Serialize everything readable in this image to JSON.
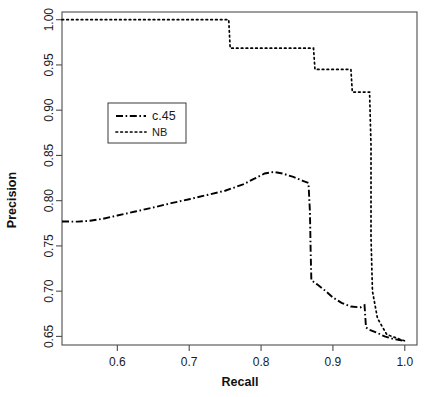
{
  "chart_data": {
    "type": "line",
    "title": "",
    "xlabel": "Recall",
    "ylabel": "Precision",
    "xlim": [
      0.523,
      1.017
    ],
    "ylim": [
      0.6405,
      1.0085
    ],
    "xticks": [
      0.6,
      0.7,
      0.8,
      0.9,
      1.0
    ],
    "xtick_labels": [
      "0.6",
      "0.7",
      "0.8",
      "0.9",
      "1.0"
    ],
    "yticks": [
      0.65,
      0.7,
      0.75,
      0.8,
      0.85,
      0.9,
      0.95,
      1.0
    ],
    "ytick_labels": [
      "0.65",
      "0.70",
      "0.75",
      "0.80",
      "0.85",
      "0.90",
      "0.95",
      "1.00"
    ],
    "grid": false,
    "legend_position": "upper-left-center",
    "series": [
      {
        "name": "c.45",
        "linestyle": "dashdot",
        "color": "#000000",
        "points": [
          [
            0.523,
            0.777
          ],
          [
            0.545,
            0.7768
          ],
          [
            0.562,
            0.7778
          ],
          [
            0.58,
            0.78
          ],
          [
            0.6,
            0.7836
          ],
          [
            0.625,
            0.788
          ],
          [
            0.65,
            0.7925
          ],
          [
            0.675,
            0.7972
          ],
          [
            0.7,
            0.8016
          ],
          [
            0.725,
            0.8063
          ],
          [
            0.75,
            0.811
          ],
          [
            0.775,
            0.818
          ],
          [
            0.79,
            0.824
          ],
          [
            0.805,
            0.83
          ],
          [
            0.818,
            0.8318
          ],
          [
            0.83,
            0.83
          ],
          [
            0.845,
            0.8262
          ],
          [
            0.858,
            0.822
          ],
          [
            0.866,
            0.8195
          ],
          [
            0.868,
            0.788
          ],
          [
            0.869,
            0.745
          ],
          [
            0.87,
            0.712
          ],
          [
            0.878,
            0.7075
          ],
          [
            0.89,
            0.7
          ],
          [
            0.9,
            0.693
          ],
          [
            0.912,
            0.687
          ],
          [
            0.925,
            0.683
          ],
          [
            0.938,
            0.682
          ],
          [
            0.944,
            0.6845
          ],
          [
            0.946,
            0.66
          ],
          [
            0.95,
            0.6575
          ],
          [
            0.96,
            0.6545
          ],
          [
            0.972,
            0.65
          ],
          [
            0.985,
            0.647
          ],
          [
            1.0,
            0.645
          ]
        ]
      },
      {
        "name": "NB",
        "linestyle": "dotted",
        "color": "#000000",
        "points": [
          [
            0.523,
            1.0
          ],
          [
            0.755,
            1.0
          ],
          [
            0.757,
            0.9685
          ],
          [
            0.873,
            0.9685
          ],
          [
            0.875,
            0.945
          ],
          [
            0.925,
            0.945
          ],
          [
            0.927,
            0.92
          ],
          [
            0.951,
            0.92
          ],
          [
            0.953,
            0.86
          ],
          [
            0.953,
            0.76
          ],
          [
            0.955,
            0.7
          ],
          [
            0.962,
            0.67
          ],
          [
            0.975,
            0.652
          ],
          [
            1.0,
            0.645
          ]
        ]
      }
    ],
    "legend_entries": [
      {
        "label": "c.45",
        "linestyle": "dashdot"
      },
      {
        "label": "NB",
        "linestyle": "dotted"
      }
    ]
  }
}
